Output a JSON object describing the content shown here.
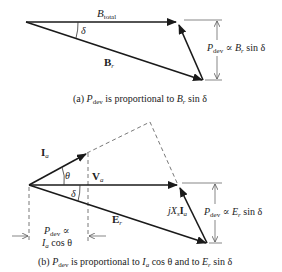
{
  "figure_a": {
    "vector_total": {
      "name": "B",
      "sub": "total"
    },
    "vector_r": {
      "name": "B",
      "sub": "r"
    },
    "angle": "δ",
    "dimension": {
      "p": "P",
      "p_sub": "dev",
      "rest": " ∝ ",
      "b": "B",
      "b_sub": "r",
      "tail": " sin δ"
    },
    "caption": {
      "prefix": "(a) ",
      "p": "P",
      "p_sub": "dev",
      "mid": " is proportional to ",
      "b": "B",
      "b_sub": "r",
      "tail": "  sin δ"
    }
  },
  "figure_b": {
    "current": {
      "name": "I",
      "sub": "a"
    },
    "voltage": {
      "name": "V",
      "sub": "a"
    },
    "emf": {
      "name": "E",
      "sub": "r"
    },
    "reactance_drop": {
      "j": "jX",
      "s": "s",
      "i": "I",
      "i_sub": "a"
    },
    "angle_theta": "θ",
    "angle_delta": "δ",
    "right_dimension": {
      "p": "P",
      "p_sub": "dev",
      "rest": " ∝ ",
      "e": "E",
      "e_sub": "r",
      "tail": " sin δ"
    },
    "left_dimension": {
      "line1_p": "P",
      "line1_sub": "dev",
      "line1_tail": " ∝",
      "line2_i": "I",
      "line2_sub": "a",
      "line2_tail": " cos θ"
    },
    "caption": {
      "prefix": "(b) ",
      "p": "P",
      "p_sub": "dev",
      "mid": " is proportional to ",
      "i": "I",
      "i_sub": "a",
      "mid2": " cos θ and to ",
      "e": "E",
      "e_sub": "r",
      "tail": " sin δ"
    }
  },
  "colors": {
    "line": "#1a1a1a",
    "dash": "#555555",
    "dim": "#555555"
  }
}
